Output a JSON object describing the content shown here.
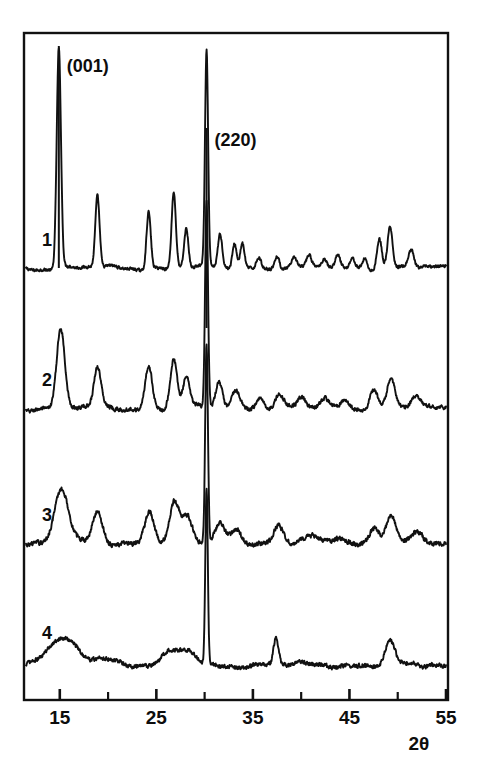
{
  "figure": {
    "name": "xrd-diffractogram",
    "background_color": "#ffffff",
    "ink_color": "#111111",
    "frame": {
      "x": 24,
      "y": 33,
      "width": 424,
      "height": 667
    }
  },
  "axis": {
    "x_label": "2θ",
    "x_tick_labels": [
      "15",
      "25",
      "35",
      "45",
      "55"
    ],
    "x_tick_values": [
      15,
      25,
      35,
      45,
      55
    ],
    "x_minor_tick_values": [
      20,
      30,
      40,
      50
    ],
    "x_min": 11.5,
    "x_max": 55
  },
  "annotations": [
    {
      "text": "(001)",
      "two_theta": 14.9,
      "name": "peak-label-001"
    },
    {
      "text": "(220)",
      "two_theta": 30.2,
      "name": "peak-label-220"
    }
  ],
  "traces": [
    {
      "label": "1",
      "name": "trace-1"
    },
    {
      "label": "2",
      "name": "trace-2"
    },
    {
      "label": "3",
      "name": "trace-3"
    },
    {
      "label": "4",
      "name": "trace-4"
    }
  ],
  "chart_data": {
    "type": "line",
    "title": "",
    "subtitle": "",
    "xlabel": "2θ",
    "ylabel": "",
    "xlim": [
      11.5,
      55
    ],
    "grid": false,
    "legend": "none",
    "x_ticks": [
      15,
      25,
      35,
      45,
      55
    ],
    "x_minor_ticks": [
      20,
      30,
      40,
      50
    ],
    "annotations": [
      {
        "label": "(001)",
        "x": 14.9
      },
      {
        "label": "(220)",
        "x": 30.2
      }
    ],
    "series": [
      {
        "name": "1",
        "baseline_y_px": 268,
        "noise": 1.6,
        "peaks": [
          {
            "x": 14.9,
            "height": 220,
            "width": 0.22,
            "label": "(001)"
          },
          {
            "x": 18.9,
            "height": 72,
            "width": 0.22
          },
          {
            "x": 24.2,
            "height": 58,
            "width": 0.22
          },
          {
            "x": 26.8,
            "height": 76,
            "width": 0.22
          },
          {
            "x": 28.1,
            "height": 40,
            "width": 0.22
          },
          {
            "x": 30.2,
            "height": 215,
            "width": 0.16,
            "label": "(220)"
          },
          {
            "x": 31.6,
            "height": 33,
            "width": 0.22
          },
          {
            "x": 33.1,
            "height": 26,
            "width": 0.22
          },
          {
            "x": 33.9,
            "height": 25,
            "width": 0.22
          },
          {
            "x": 35.6,
            "height": 12,
            "width": 0.25
          },
          {
            "x": 37.5,
            "height": 14,
            "width": 0.25
          },
          {
            "x": 39.3,
            "height": 9,
            "width": 0.25
          },
          {
            "x": 40.8,
            "height": 11,
            "width": 0.25
          },
          {
            "x": 42.4,
            "height": 10,
            "width": 0.25
          },
          {
            "x": 43.8,
            "height": 12,
            "width": 0.25
          },
          {
            "x": 45.3,
            "height": 10,
            "width": 0.25
          },
          {
            "x": 46.6,
            "height": 12,
            "width": 0.25
          },
          {
            "x": 48.1,
            "height": 30,
            "width": 0.25
          },
          {
            "x": 49.2,
            "height": 42,
            "width": 0.25
          },
          {
            "x": 51.4,
            "height": 18,
            "width": 0.28
          }
        ]
      },
      {
        "name": "2",
        "baseline_y_px": 408,
        "noise": 2.2,
        "peaks": [
          {
            "x": 15.1,
            "height": 78,
            "width": 0.42
          },
          {
            "x": 18.9,
            "height": 40,
            "width": 0.36
          },
          {
            "x": 24.2,
            "height": 42,
            "width": 0.36
          },
          {
            "x": 26.8,
            "height": 48,
            "width": 0.36
          },
          {
            "x": 28.1,
            "height": 30,
            "width": 0.34
          },
          {
            "x": 30.2,
            "height": 205,
            "width": 0.15,
            "label": "(220)"
          },
          {
            "x": 31.5,
            "height": 26,
            "width": 0.34
          },
          {
            "x": 33.2,
            "height": 18,
            "width": 0.4
          },
          {
            "x": 35.7,
            "height": 12,
            "width": 0.4
          },
          {
            "x": 37.7,
            "height": 14,
            "width": 0.4
          },
          {
            "x": 40.0,
            "height": 10,
            "width": 0.4
          },
          {
            "x": 42.4,
            "height": 9,
            "width": 0.4
          },
          {
            "x": 44.5,
            "height": 10,
            "width": 0.4
          },
          {
            "x": 47.5,
            "height": 18,
            "width": 0.4
          },
          {
            "x": 49.3,
            "height": 30,
            "width": 0.4
          },
          {
            "x": 51.8,
            "height": 10,
            "width": 0.45
          }
        ]
      },
      {
        "name": "3",
        "baseline_y_px": 543,
        "noise": 2.6,
        "peaks": [
          {
            "x": 15.2,
            "height": 54,
            "width": 0.72
          },
          {
            "x": 18.9,
            "height": 30,
            "width": 0.5
          },
          {
            "x": 24.3,
            "height": 32,
            "width": 0.5
          },
          {
            "x": 26.9,
            "height": 40,
            "width": 0.5
          },
          {
            "x": 28.2,
            "height": 24,
            "width": 0.5
          },
          {
            "x": 30.2,
            "height": 200,
            "width": 0.14,
            "label": "(220)"
          },
          {
            "x": 31.6,
            "height": 20,
            "width": 0.5
          },
          {
            "x": 33.3,
            "height": 14,
            "width": 0.55
          },
          {
            "x": 37.6,
            "height": 16,
            "width": 0.45
          },
          {
            "x": 41.0,
            "height": 7,
            "width": 0.6
          },
          {
            "x": 44.0,
            "height": 7,
            "width": 0.6
          },
          {
            "x": 47.6,
            "height": 14,
            "width": 0.5
          },
          {
            "x": 49.3,
            "height": 28,
            "width": 0.5
          },
          {
            "x": 52.0,
            "height": 8,
            "width": 0.6
          }
        ]
      },
      {
        "name": "4",
        "baseline_y_px": 665,
        "noise": 2.4,
        "peaks": [
          {
            "x": 15.2,
            "height": 26,
            "width": 1.5
          },
          {
            "x": 19.8,
            "height": 8,
            "width": 1.0
          },
          {
            "x": 26.8,
            "height": 14,
            "width": 1.0
          },
          {
            "x": 28.6,
            "height": 10,
            "width": 0.7
          },
          {
            "x": 30.2,
            "height": 175,
            "width": 0.13,
            "label": "(220)"
          },
          {
            "x": 37.4,
            "height": 26,
            "width": 0.25
          },
          {
            "x": 49.2,
            "height": 22,
            "width": 0.5
          }
        ]
      }
    ]
  }
}
